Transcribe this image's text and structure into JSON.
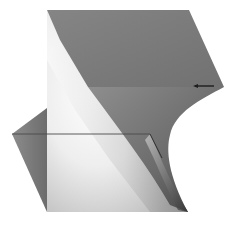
{
  "figure": {
    "title": "",
    "colors": {
      "background": "#ffffff",
      "top_face": "#7a7a7a",
      "mid_band": "#6e6e6e",
      "wedge": "#7c7c7c",
      "highlight": "#ffffff",
      "edge_line": "#3a3a3a"
    },
    "vertices": {
      "top_left": [
        47,
        10
      ],
      "top_right": [
        189,
        10
      ],
      "right_tip": [
        224,
        87
      ],
      "fold_left": [
        88,
        87
      ],
      "curve_bottom": [
        165,
        165
      ],
      "wedge_top": [
        47,
        108
      ],
      "wedge_tip": [
        12,
        134
      ],
      "bottom_left": [
        47,
        212
      ],
      "bottom_right": [
        188,
        212
      ]
    },
    "annotations": [
      {
        "type": "horizontal-edge",
        "from": [
          12,
          134
        ],
        "to": [
          150,
          134
        ]
      },
      {
        "type": "arrow-mark",
        "at": [
          195,
          86
        ]
      },
      {
        "type": "tick-line",
        "from": [
          150,
          134
        ],
        "to": [
          162,
          158
        ]
      }
    ]
  }
}
